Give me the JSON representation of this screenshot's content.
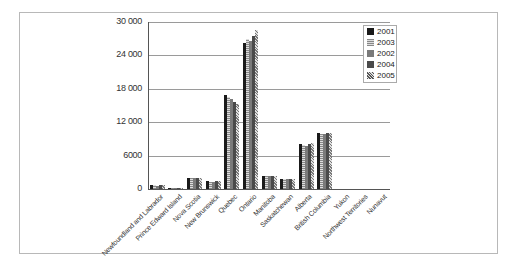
{
  "chart_data": {
    "type": "bar",
    "title": "",
    "xlabel": "",
    "ylabel": "",
    "ylim": [
      0,
      30000
    ],
    "yticks": [
      "0",
      "6000",
      "12 000",
      "18 000",
      "24 000",
      "30 000"
    ],
    "ytick_values": [
      0,
      6000,
      12000,
      18000,
      24000,
      30000
    ],
    "grid": true,
    "legend_position": "top-right",
    "categories": [
      "Newfoundland and Labrador",
      "Prince Edward Island",
      "Nova Scotia",
      "New Brunswick",
      "Quebec",
      "Ontario",
      "Manitoba",
      "Saskatchewan",
      "Alberta",
      "British Columbia",
      "Yukon",
      "Northwest Territories",
      "Nunavut"
    ],
    "series": [
      {
        "name": "2001",
        "color": "#1a1a1a",
        "values": [
          700,
          250,
          1900,
          1400,
          16900,
          26300,
          2300,
          1800,
          8000,
          10100,
          70,
          80,
          40
        ]
      },
      {
        "name": "2003",
        "color": "#a8a8a8",
        "values": [
          650,
          230,
          1950,
          1350,
          16500,
          27000,
          2300,
          1800,
          7900,
          9900,
          70,
          80,
          40
        ]
      },
      {
        "name": "2002",
        "color": "#7a7a7a",
        "values": [
          620,
          220,
          1900,
          1350,
          16100,
          26600,
          2250,
          1750,
          7800,
          9800,
          70,
          80,
          40
        ]
      },
      {
        "name": "2004",
        "color": "#4a4a4a",
        "values": [
          680,
          240,
          1950,
          1400,
          15700,
          27500,
          2300,
          1800,
          8100,
          10000,
          70,
          80,
          40
        ]
      },
      {
        "name": "2005",
        "color": "#c8c8c8",
        "values": [
          720,
          260,
          2000,
          1400,
          15300,
          28600,
          2300,
          1800,
          8200,
          10000,
          70,
          80,
          40
        ]
      }
    ]
  }
}
